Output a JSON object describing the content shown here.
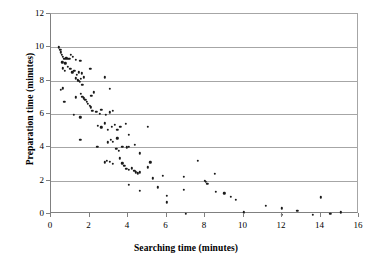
{
  "chart_data": {
    "type": "scatter",
    "title": "",
    "xlabel": "Searching time (minutes)",
    "ylabel": "Preparation time (minutes)",
    "xlim": [
      0,
      16
    ],
    "ylim": [
      0,
      12
    ],
    "xticks": [
      0,
      2,
      4,
      6,
      8,
      10,
      12,
      14,
      16
    ],
    "yticks": [
      0,
      2,
      4,
      6,
      8,
      10,
      12
    ],
    "grid": "horizontal",
    "legend": "none",
    "marker": {
      "shape": "circle",
      "color": "#1a1a1a",
      "size": 2.4
    },
    "series": [
      {
        "name": "observations",
        "points": [
          [
            0.42,
            10.0
          ],
          [
            0.48,
            9.85
          ],
          [
            0.52,
            9.7
          ],
          [
            0.55,
            9.55
          ],
          [
            0.62,
            9.45
          ],
          [
            0.7,
            9.3
          ],
          [
            0.58,
            9.1
          ],
          [
            0.75,
            9.05
          ],
          [
            0.8,
            9.35
          ],
          [
            0.88,
            9.3
          ],
          [
            0.95,
            9.3
          ],
          [
            1.02,
            9.55
          ],
          [
            1.12,
            9.45
          ],
          [
            1.3,
            9.25
          ],
          [
            1.52,
            9.2
          ],
          [
            0.62,
            8.75
          ],
          [
            0.72,
            8.6
          ],
          [
            0.88,
            8.85
          ],
          [
            1.0,
            8.7
          ],
          [
            1.1,
            8.5
          ],
          [
            1.22,
            8.6
          ],
          [
            1.35,
            8.35
          ],
          [
            1.45,
            8.5
          ],
          [
            1.6,
            8.45
          ],
          [
            2.05,
            8.7
          ],
          [
            0.5,
            7.45
          ],
          [
            0.62,
            7.55
          ],
          [
            1.3,
            8.15
          ],
          [
            1.38,
            8.05
          ],
          [
            1.42,
            8.0
          ],
          [
            1.5,
            7.95
          ],
          [
            1.55,
            8.1
          ],
          [
            1.62,
            7.75
          ],
          [
            1.7,
            8.2
          ],
          [
            2.78,
            8.2
          ],
          [
            0.7,
            6.75
          ],
          [
            1.3,
            7.0
          ],
          [
            1.55,
            7.2
          ],
          [
            1.62,
            7.05
          ],
          [
            1.7,
            6.95
          ],
          [
            1.78,
            6.85
          ],
          [
            1.85,
            6.75
          ],
          [
            1.92,
            6.6
          ],
          [
            2.0,
            6.5
          ],
          [
            2.1,
            7.1
          ],
          [
            2.22,
            7.3
          ],
          [
            3.05,
            7.5
          ],
          [
            1.18,
            5.95
          ],
          [
            1.52,
            5.8
          ],
          [
            2.08,
            6.4
          ],
          [
            2.15,
            6.2
          ],
          [
            2.35,
            6.15
          ],
          [
            2.55,
            6.0
          ],
          [
            2.62,
            6.25
          ],
          [
            2.85,
            5.95
          ],
          [
            3.05,
            6.1
          ],
          [
            3.22,
            6.2
          ],
          [
            1.52,
            4.45
          ],
          [
            2.42,
            5.3
          ],
          [
            2.62,
            5.2
          ],
          [
            2.78,
            5.45
          ],
          [
            2.95,
            5.05
          ],
          [
            3.15,
            5.25
          ],
          [
            3.3,
            5.35
          ],
          [
            3.45,
            5.05
          ],
          [
            3.6,
            5.25
          ],
          [
            3.9,
            5.4
          ],
          [
            4.05,
            4.75
          ],
          [
            5.02,
            5.25
          ],
          [
            2.4,
            4.05
          ],
          [
            2.95,
            4.3
          ],
          [
            3.1,
            4.45
          ],
          [
            3.22,
            4.35
          ],
          [
            3.45,
            4.55
          ],
          [
            3.7,
            4.05
          ],
          [
            3.95,
            4.0
          ],
          [
            4.05,
            4.05
          ],
          [
            4.35,
            4.15
          ],
          [
            4.6,
            3.65
          ],
          [
            2.78,
            3.1
          ],
          [
            2.9,
            3.2
          ],
          [
            3.05,
            3.15
          ],
          [
            3.22,
            3.0
          ],
          [
            3.4,
            3.9
          ],
          [
            3.52,
            3.8
          ],
          [
            3.58,
            3.35
          ],
          [
            3.7,
            3.05
          ],
          [
            3.8,
            2.9
          ],
          [
            3.92,
            2.7
          ],
          [
            4.05,
            2.65
          ],
          [
            4.2,
            2.75
          ],
          [
            4.32,
            2.6
          ],
          [
            4.42,
            2.5
          ],
          [
            4.5,
            2.45
          ],
          [
            4.62,
            2.5
          ],
          [
            5.02,
            2.8
          ],
          [
            5.15,
            3.1
          ],
          [
            7.62,
            3.2
          ],
          [
            5.3,
            2.15
          ],
          [
            5.82,
            2.3
          ],
          [
            6.9,
            2.25
          ],
          [
            8.5,
            2.4
          ],
          [
            7.98,
            2.0
          ],
          [
            8.05,
            1.95
          ],
          [
            8.12,
            1.8
          ],
          [
            4.05,
            1.75
          ],
          [
            4.62,
            1.4
          ],
          [
            5.55,
            1.6
          ],
          [
            6.0,
            1.1
          ],
          [
            6.0,
            0.7
          ],
          [
            6.9,
            1.45
          ],
          [
            8.55,
            1.35
          ],
          [
            9.0,
            1.25
          ],
          [
            9.35,
            1.05
          ],
          [
            9.6,
            0.85
          ],
          [
            7.0,
            0.0
          ],
          [
            10.0,
            0.1
          ],
          [
            11.15,
            0.5
          ],
          [
            12.0,
            0.35
          ],
          [
            12.0,
            -0.05
          ],
          [
            12.8,
            0.2
          ],
          [
            13.6,
            -0.05
          ],
          [
            14.0,
            1.0
          ],
          [
            14.5,
            0.0
          ],
          [
            15.05,
            0.1
          ]
        ]
      }
    ]
  },
  "axes": {
    "x_tick_labels": [
      "0",
      "2",
      "4",
      "6",
      "8",
      "10",
      "12",
      "14",
      "16"
    ],
    "y_tick_labels": [
      "0",
      "2",
      "4",
      "6",
      "8",
      "10",
      "12"
    ]
  }
}
